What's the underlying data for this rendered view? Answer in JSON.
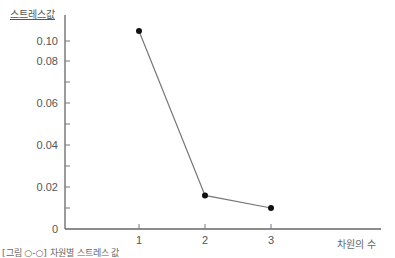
{
  "chart_data": {
    "type": "line",
    "title": "",
    "xlabel": "차원의 수",
    "ylabel": "스트레스값",
    "x": [
      1,
      2,
      3
    ],
    "series": [
      {
        "name": "스트레스값",
        "values": [
          0.11,
          0.016,
          0.01
        ]
      }
    ],
    "x_ticks": [
      "1",
      "2",
      "3"
    ],
    "y_ticks": [
      "0",
      "0.02",
      "0.04",
      "0.06",
      "0.08",
      "0.10"
    ],
    "ylim": [
      0,
      0.12
    ],
    "grid": false,
    "legend": "none",
    "caption": "[그림 ○-○] 차원별 스트레스 값"
  }
}
